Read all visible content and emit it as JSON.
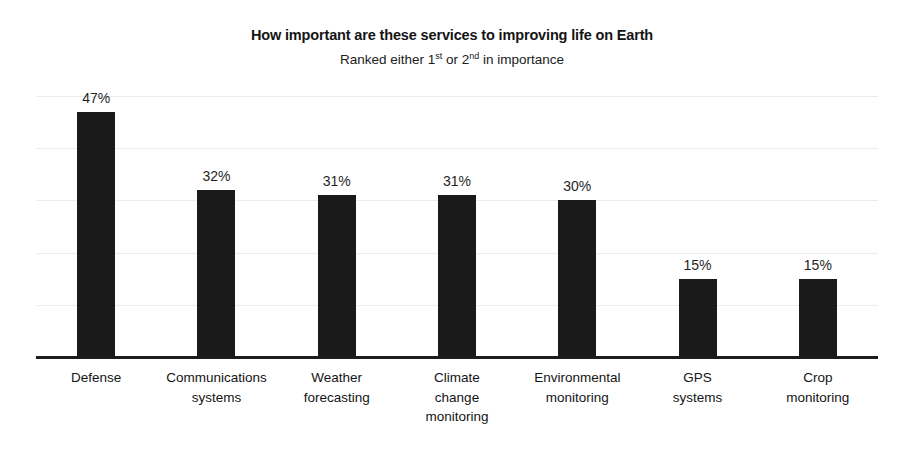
{
  "chart_data": {
    "type": "bar",
    "title": "How important are these services to improving life on Earth",
    "subtitle_parts": {
      "a": "Ranked either 1",
      "sup1": "st",
      "b": " or 2",
      "sup2": "nd",
      "c": " in importance"
    },
    "subtitle": "Ranked either 1st or 2nd in importance",
    "categories": [
      "Defense",
      "Communications systems",
      "Weather forecasting",
      "Climate change monitoring",
      "Environmental monitoring",
      "GPS systems",
      "Crop monitoring"
    ],
    "category_lines": [
      [
        "Defense"
      ],
      [
        "Communications",
        "systems"
      ],
      [
        "Weather",
        "forecasting"
      ],
      [
        "Climate",
        "change",
        "monitoring"
      ],
      [
        "Environmental",
        "monitoring"
      ],
      [
        "GPS",
        "systems"
      ],
      [
        "Crop",
        "monitoring"
      ]
    ],
    "values": [
      47,
      32,
      31,
      31,
      30,
      15,
      15
    ],
    "value_labels": [
      "47%",
      "32%",
      "31%",
      "31%",
      "30%",
      "15%",
      "15%"
    ],
    "xlabel": "",
    "ylabel": "",
    "ylim": [
      0,
      50
    ],
    "yticks": [
      0,
      10,
      20,
      30,
      40,
      50
    ],
    "grid": true,
    "axis_tick_labels_visible": false,
    "legend": null,
    "legend_position": "none",
    "units": "percent",
    "colors": {
      "bar": "#1a1a1a",
      "background": "#ffffff",
      "gridline": "#ececec",
      "axis": "#1c1c1c",
      "text": "#141414"
    }
  }
}
